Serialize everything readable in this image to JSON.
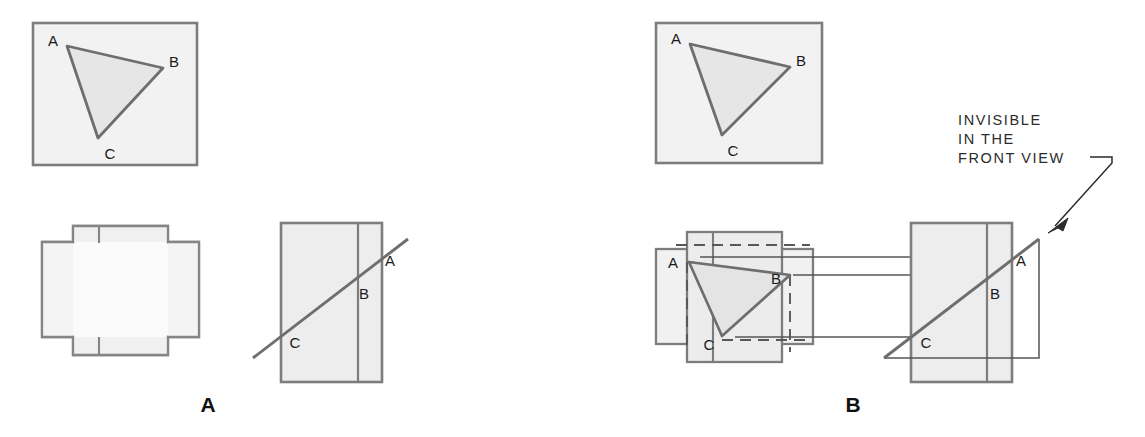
{
  "figure": {
    "width": 1145,
    "height": 437,
    "background_color": "#ffffff"
  },
  "style": {
    "fill_gray": "#efefef",
    "fill_gray_dark": "#e6e6e6",
    "outline_gray": "#808080",
    "outline_thick": "#6e6e6e",
    "thin_line": "#555555",
    "label_color": "#1a1a1a",
    "caption_color": "#111111",
    "note_color": "#2b2b2b"
  },
  "panels": [
    {
      "id": "panel-a",
      "caption": "A",
      "caption_x": 208,
      "caption_y": 412,
      "description": "Pictorial view plus incomplete orthographic views"
    },
    {
      "id": "panel-b",
      "caption": "B",
      "caption_x": 853,
      "caption_y": 412,
      "description": "Pictorial view plus completed orthographic views with hidden lines"
    }
  ],
  "vertex_labels": {
    "a": "A",
    "b": "B",
    "c": "C"
  },
  "panel_a": {
    "pictorial": {
      "name": "pictorial-view",
      "rect": {
        "x": 33,
        "y": 23,
        "w": 164,
        "h": 142
      },
      "triangle": {
        "ax": 67,
        "ay": 46,
        "bx": 163,
        "by": 68,
        "cx": 98,
        "cy": 138
      },
      "labels": [
        {
          "text": "A",
          "x": 53,
          "y": 46
        },
        {
          "text": "B",
          "x": 172,
          "y": 66
        },
        {
          "text": "C",
          "x": 110,
          "y": 158
        }
      ]
    },
    "top_view": {
      "name": "top-view",
      "labels": []
    },
    "side_view": {
      "name": "side-view",
      "rect": {
        "x": 281,
        "y": 223,
        "w": 101,
        "h": 159
      },
      "divider_x": 358,
      "edge_line": {
        "x1": 253,
        "y1": 358,
        "x2": 408,
        "y2": 239
      },
      "labels": [
        {
          "text": "A",
          "x": 390,
          "y": 265
        },
        {
          "text": "B",
          "x": 364,
          "y": 298
        },
        {
          "text": "C",
          "x": 295,
          "y": 347
        }
      ]
    }
  },
  "panel_b": {
    "pictorial": {
      "name": "pictorial-view",
      "rect": {
        "x": 656,
        "y": 23,
        "w": 166,
        "h": 140
      },
      "triangle": {
        "ax": 690,
        "ay": 44,
        "bx": 790,
        "by": 67,
        "cx": 722,
        "cy": 135
      },
      "labels": [
        {
          "text": "A",
          "x": 676,
          "y": 44
        },
        {
          "text": "B",
          "x": 799,
          "y": 66
        },
        {
          "text": "C",
          "x": 733,
          "y": 155
        }
      ]
    },
    "top_view": {
      "name": "top-view",
      "triangle": {
        "ax": 689,
        "ay": 262,
        "bx": 790,
        "by": 275,
        "cx": 722,
        "cy": 336
      },
      "labels": [
        {
          "text": "A",
          "x": 673,
          "y": 263
        },
        {
          "text": "B",
          "x": 774,
          "y": 277
        },
        {
          "text": "C",
          "x": 708,
          "y": 348
        }
      ]
    },
    "side_view": {
      "name": "side-view",
      "rect": {
        "x": 911,
        "y": 223,
        "w": 101,
        "h": 159
      },
      "divider_x": 987,
      "edge_line": {
        "x1": 884,
        "y1": 358,
        "x2": 1039,
        "y2": 239
      },
      "labels": [
        {
          "text": "A",
          "x": 1021,
          "y": 265
        },
        {
          "text": "B",
          "x": 995,
          "y": 298
        },
        {
          "text": "C",
          "x": 926,
          "y": 347
        }
      ]
    },
    "note": {
      "name": "invisible-in-front-view-note",
      "lines": [
        "INVISIBLE",
        "IN THE",
        "FRONT VIEW"
      ],
      "x": 958,
      "y": 125,
      "line_height": 19,
      "leader": {
        "polyline": "1093,150 1110,150 1110,155 1050,228",
        "arrow_tip_x": 1048,
        "arrow_tip_y": 230
      }
    },
    "projection_lines": [
      {
        "y": 257,
        "x1": 800,
        "x2": 1012
      },
      {
        "y": 275,
        "x1": 812,
        "x2": 1012
      },
      {
        "y": 337,
        "x1": 800,
        "x2": 1012
      }
    ]
  }
}
